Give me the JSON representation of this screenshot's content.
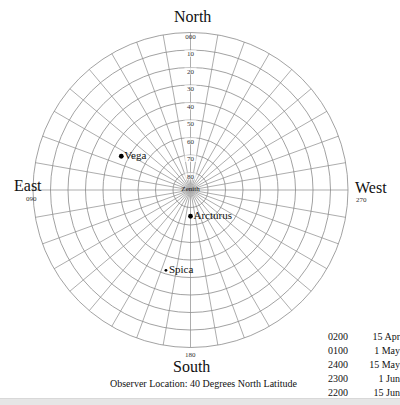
{
  "chart_data": {
    "type": "polar-sky-chart",
    "title": "",
    "center_label": "Zenith",
    "directions": {
      "north": {
        "label": "North",
        "azimuth": "000"
      },
      "east": {
        "label": "East",
        "azimuth": "090"
      },
      "south": {
        "label": "South",
        "azimuth": "180"
      },
      "west": {
        "label": "West",
        "azimuth": "270"
      }
    },
    "altitude_rings": [
      0,
      10,
      20,
      30,
      40,
      50,
      60,
      70,
      80
    ],
    "altitude_labels": [
      "000",
      "10",
      "20",
      "30",
      "40",
      "50",
      "60",
      "70",
      "80"
    ],
    "azimuth_spoke_step_deg": 10,
    "stars": [
      {
        "name": "Vega",
        "azimuth": 64,
        "altitude": 46,
        "magnitude_size": "large"
      },
      {
        "name": "Arcturus",
        "azimuth": 180,
        "altitude": 75,
        "magnitude_size": "large"
      },
      {
        "name": "Spica",
        "azimuth": 163,
        "altitude": 42,
        "magnitude_size": "small"
      }
    ],
    "grid": true,
    "legend_position": "bottom-right"
  },
  "observer_note": "Observer Location: 40 Degrees North Latitude",
  "times": [
    {
      "time": "0200",
      "date": "15 Apr"
    },
    {
      "time": "0100",
      "date": "1 May"
    },
    {
      "time": "2400",
      "date": "15 May"
    },
    {
      "time": "2300",
      "date": "1 Jun"
    },
    {
      "time": "2200",
      "date": "15 Jun"
    }
  ],
  "colors": {
    "grid": "#8a8a8a",
    "star": "#000000",
    "text": "#111111"
  }
}
